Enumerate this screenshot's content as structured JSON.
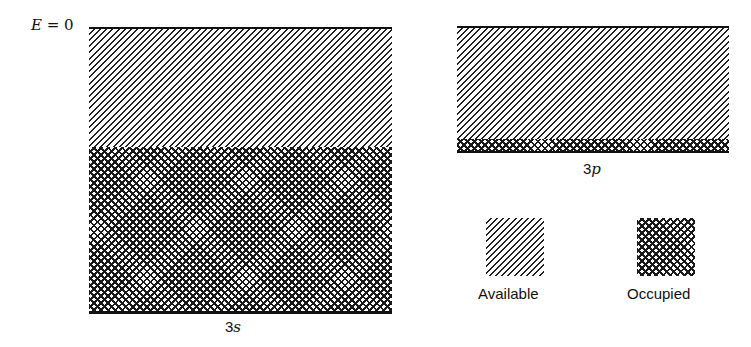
{
  "diagram": {
    "energy_label": {
      "var": "E",
      "eq": " = 0"
    },
    "bands": [
      {
        "name": "3s",
        "num": "3",
        "letter": "s",
        "available_fraction": 0.42,
        "occupied_fraction": 0.58
      },
      {
        "name": "3p",
        "num": "3",
        "letter": "p",
        "available_fraction": 0.9,
        "occupied_fraction": 0.1
      }
    ],
    "legend": [
      {
        "label": "Available",
        "pattern": "diagonal-hatch"
      },
      {
        "label": "Occupied",
        "pattern": "cross-hatch"
      }
    ],
    "colors": {
      "ink": "#111111",
      "background": "#ffffff"
    }
  }
}
